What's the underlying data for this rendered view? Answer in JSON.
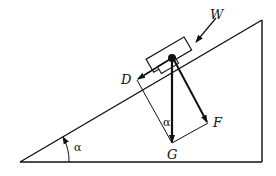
{
  "diagram": {
    "labels": {
      "W": "W",
      "D": "D",
      "F": "F",
      "G": "G",
      "alpha_incline": "α",
      "alpha_force": "α"
    },
    "colors": {
      "stroke": "#111111",
      "background": "#ffffff"
    }
  }
}
